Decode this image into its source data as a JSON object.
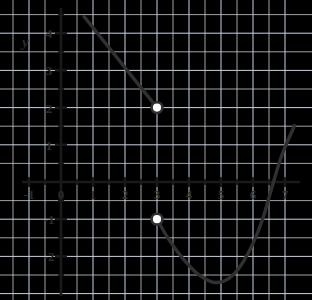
{
  "figure": {
    "name": "piecewise-function-graph",
    "background_color": "#fefefe",
    "grid_color": "#c9d2e0",
    "minor_grid_color": "#e2e7ef",
    "axis_color": "#1a1a1a",
    "curve_color": "#303030",
    "y_axis_label": "y"
  },
  "chart_data": {
    "type": "line",
    "title": "",
    "xlabel": "",
    "ylabel": "y",
    "xlim": [
      -1.6,
      7.45
    ],
    "ylim": [
      -3.2,
      4.6
    ],
    "grid": true,
    "minor_grid": true,
    "legend": "none",
    "x_ticks": [
      -1,
      0,
      1,
      2,
      3,
      4,
      5,
      6,
      7
    ],
    "x_tick_labels": [
      "-1",
      "0",
      "1",
      "2",
      "3",
      "4",
      "5",
      "6",
      "7"
    ],
    "y_ticks": [
      -2,
      -1,
      1,
      2,
      3,
      4
    ],
    "y_tick_labels": [
      "-2",
      "-1",
      "1",
      "2",
      "3",
      "4"
    ],
    "minor_tick_step": 0.5,
    "series": [
      {
        "name": "left-branch-line-segment",
        "type": "line",
        "style": "solid",
        "points": [
          [
            0.72,
            4.45
          ],
          [
            3.0,
            2.0
          ]
        ],
        "start_marker": "none",
        "end_marker": "open-circle",
        "end_point": [
          3,
          2
        ]
      },
      {
        "name": "right-branch-curve",
        "type": "curve",
        "style": "solid",
        "points": [
          [
            3.0,
            -1.0
          ],
          [
            3.3,
            -1.45
          ],
          [
            3.6,
            -1.83
          ],
          [
            3.9,
            -2.15
          ],
          [
            4.2,
            -2.42
          ],
          [
            4.5,
            -2.6
          ],
          [
            4.8,
            -2.7
          ],
          [
            5.1,
            -2.66
          ],
          [
            5.4,
            -2.48
          ],
          [
            5.7,
            -2.14
          ],
          [
            6.0,
            -1.65
          ],
          [
            6.3,
            -1.0
          ],
          [
            6.6,
            -0.12
          ],
          [
            6.9,
            0.72
          ],
          [
            7.3,
            1.52
          ]
        ],
        "start_marker": "open-circle",
        "start_point": [
          3,
          -1
        ],
        "end_marker": "none",
        "minimum": [
          4.8,
          -2.7
        ],
        "x_intercept": 6.62
      }
    ],
    "open_circles": [
      {
        "name": "open-circle-upper",
        "x": 3,
        "y": 2
      },
      {
        "name": "open-circle-lower",
        "x": 3,
        "y": -1
      }
    ]
  }
}
